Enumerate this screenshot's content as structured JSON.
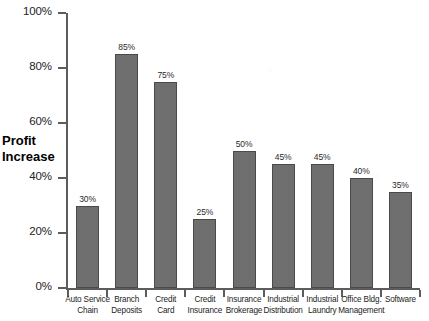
{
  "chart_data": {
    "type": "bar",
    "title": "",
    "xlabel": "",
    "ylabel": "Profit Increase",
    "ylim": [
      0,
      100
    ],
    "ytick_labels": [
      "100%",
      "80%",
      "60%",
      "40%",
      "20%",
      "0%"
    ],
    "ytick_values": [
      100,
      80,
      60,
      40,
      20,
      0
    ],
    "grid": false,
    "legend": "none",
    "value_label_suffix": "%",
    "categories": [
      "Auto Service Chain",
      "Branch Deposits",
      "Credit Card",
      "Credit Insurance",
      "Insurance Brokerage",
      "Industrial Distribution",
      "Industrial Laundry",
      "Office Bldg. Management",
      "Software"
    ],
    "category_lines": [
      [
        "Auto Service",
        "Chain"
      ],
      [
        "Branch",
        "Deposits"
      ],
      [
        "Credit",
        "Card"
      ],
      [
        "Credit",
        "Insurance"
      ],
      [
        "Insurance",
        "Brokerage"
      ],
      [
        "Industrial",
        "Distribution"
      ],
      [
        "Industrial",
        "Laundry"
      ],
      [
        "Office Bldg.",
        "Management"
      ],
      [
        "Software"
      ]
    ],
    "values": [
      30,
      85,
      75,
      25,
      50,
      45,
      45,
      40,
      35
    ],
    "value_labels": [
      "30%",
      "85%",
      "75%",
      "25%",
      "50%",
      "45%",
      "45%",
      "40%",
      "35%"
    ],
    "colors": {
      "bar_fill": "#6e6e6e",
      "bar_stroke": "#4a4a4a",
      "axis": "#5c5c5c",
      "text": "#1d1d1d",
      "background": "#ffffff"
    }
  },
  "axis_title": {
    "line1": "Profit",
    "line2": "Increase"
  }
}
